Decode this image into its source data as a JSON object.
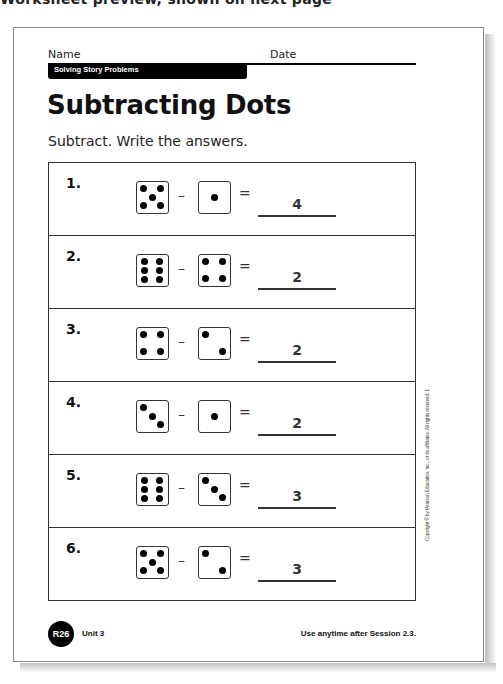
{
  "top_cut_text": "Worksheet preview, shown on next page",
  "worksheet": {
    "name_label": "Name",
    "date_label": "Date",
    "banner": "Solving Story Problems",
    "title": "Subtracting Dots",
    "instructions": "Subtract. Write the answers.",
    "problems": [
      {
        "number": "1.",
        "minuend_pips": 5,
        "subtrahend_pips": 1,
        "minus": "–",
        "equals": "=",
        "answer": "4"
      },
      {
        "number": "2.",
        "minuend_pips": 6,
        "subtrahend_pips": 4,
        "minus": "–",
        "equals": "=",
        "answer": "2"
      },
      {
        "number": "3.",
        "minuend_pips": 4,
        "subtrahend_pips": 2,
        "minus": "–",
        "equals": "=",
        "answer": "2"
      },
      {
        "number": "4.",
        "minuend_pips": 3,
        "subtrahend_pips": 1,
        "minus": "–",
        "equals": "=",
        "answer": "2"
      },
      {
        "number": "5.",
        "minuend_pips": 6,
        "subtrahend_pips": 3,
        "minus": "–",
        "equals": "=",
        "answer": "3"
      },
      {
        "number": "6.",
        "minuend_pips": 5,
        "subtrahend_pips": 2,
        "minus": "–",
        "equals": "=",
        "answer": "3"
      }
    ],
    "copyright": "Copyright © by Pearson Education, Inc., or its affiliates. All rights reserved. 1",
    "footer": {
      "page_badge": "R26",
      "unit": "Unit 3",
      "session_note": "Use anytime after Session 2.3."
    }
  }
}
